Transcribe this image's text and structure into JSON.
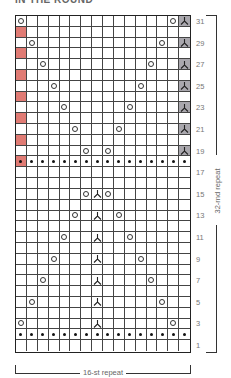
{
  "title": "IN THE ROUND",
  "grid": {
    "columns": 16,
    "rows": 31,
    "colors": {
      "red": "#e07b74",
      "gray": "#a9a7ad",
      "line": "#444444"
    },
    "row_labels": [
      "31",
      "29",
      "27",
      "25",
      "23",
      "21",
      "19",
      "17",
      "15",
      "13",
      "11",
      "9",
      "7",
      "5",
      "3",
      "1"
    ],
    "rounds": [
      {
        "round": 31,
        "cells": {
          "1": "yo",
          "15": "yo",
          "16": "sk2p-gray"
        }
      },
      {
        "round": 30,
        "cells": {
          "1": "red"
        }
      },
      {
        "round": 29,
        "cells": {
          "2": "yo",
          "14": "yo",
          "16": "sk2p-gray"
        }
      },
      {
        "round": 28,
        "cells": {
          "1": "red"
        }
      },
      {
        "round": 27,
        "cells": {
          "3": "yo",
          "13": "yo",
          "16": "sk2p-gray"
        }
      },
      {
        "round": 26,
        "cells": {
          "1": "red"
        }
      },
      {
        "round": 25,
        "cells": {
          "4": "yo",
          "12": "yo",
          "16": "sk2p-gray"
        }
      },
      {
        "round": 24,
        "cells": {
          "1": "red"
        }
      },
      {
        "round": 23,
        "cells": {
          "5": "yo",
          "11": "yo",
          "16": "sk2p-gray"
        }
      },
      {
        "round": 22,
        "cells": {
          "1": "red"
        }
      },
      {
        "round": 21,
        "cells": {
          "6": "yo",
          "10": "yo",
          "16": "sk2p-gray"
        }
      },
      {
        "round": 20,
        "cells": {
          "1": "red"
        }
      },
      {
        "round": 19,
        "cells": {
          "7": "yo",
          "9": "yo",
          "16": "sk2p-gray"
        }
      },
      {
        "round": 18,
        "cells": {
          "all": "purl",
          "1": "red-purl"
        }
      },
      {
        "round": 17,
        "cells": {}
      },
      {
        "round": 16,
        "cells": {}
      },
      {
        "round": 15,
        "cells": {
          "7": "yo",
          "8": "sk2p",
          "9": "yo"
        }
      },
      {
        "round": 14,
        "cells": {}
      },
      {
        "round": 13,
        "cells": {
          "6": "yo",
          "8": "sk2p",
          "10": "yo"
        }
      },
      {
        "round": 12,
        "cells": {}
      },
      {
        "round": 11,
        "cells": {
          "5": "yo",
          "8": "sk2p",
          "11": "yo"
        }
      },
      {
        "round": 10,
        "cells": {}
      },
      {
        "round": 9,
        "cells": {
          "4": "yo",
          "8": "sk2p",
          "12": "yo"
        }
      },
      {
        "round": 8,
        "cells": {}
      },
      {
        "round": 7,
        "cells": {
          "3": "yo",
          "8": "sk2p",
          "13": "yo"
        }
      },
      {
        "round": 6,
        "cells": {}
      },
      {
        "round": 5,
        "cells": {
          "2": "yo",
          "8": "sk2p",
          "14": "yo"
        }
      },
      {
        "round": 4,
        "cells": {}
      },
      {
        "round": 3,
        "cells": {
          "1": "yo",
          "8": "sk2p",
          "15": "yo"
        }
      },
      {
        "round": 2,
        "cells": {
          "all": "purl"
        }
      },
      {
        "round": 1,
        "cells": {}
      }
    ]
  },
  "repeats": {
    "vertical_label": "32-rnd repeat",
    "horizontal_label": "16-st repeat"
  }
}
